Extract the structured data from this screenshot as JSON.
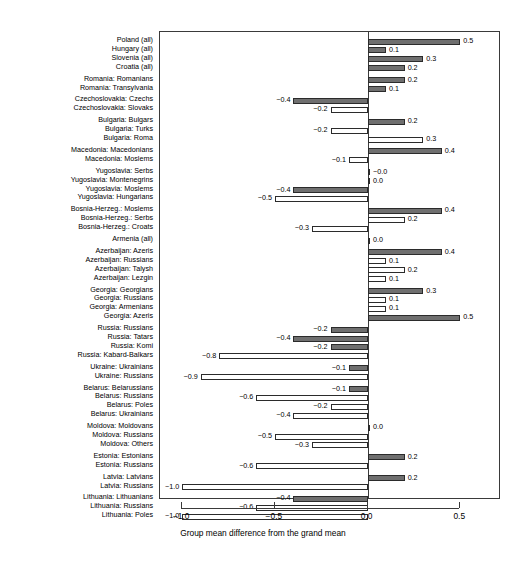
{
  "chart_data": {
    "type": "bar",
    "orientation": "horizontal",
    "title": "",
    "subtitle": "",
    "xlabel": "Group mean difference from the grand mean",
    "ylabel": "",
    "xlim": [
      -1.12,
      0.72
    ],
    "xticks": [
      -1.0,
      -0.5,
      0.0,
      0.5
    ],
    "xticklabels": [
      "-1.0",
      "-0.5",
      "0.0",
      "0.5"
    ],
    "grid": false,
    "legend": null,
    "series_note": "Filled bars = titular / majority group; open (white) bars = minority group",
    "categories": [
      "Poland (all)",
      "Hungary (all)",
      "Slovenia (all)",
      "Croatia (all)",
      "Romania: Romanians",
      "Romania: Transylvania",
      "Czechoslovakia: Czechs",
      "Czechoslovakia: Slovaks",
      "Bulgaria: Bulgars",
      "Bulgaria: Turks",
      "Bulgaria: Roma",
      "Macedonia: Macedonians",
      "Macedonia: Moslems",
      "Yugoslavia: Serbs",
      "Yugoslavia: Montenegrins",
      "Yugoslavia: Moslems",
      "Yugoslavia: Hungarians",
      "Bosnia-Herzeg.: Moslems",
      "Bosnia-Herzeg.: Serbs",
      "Bosnia-Herzeg.: Croats",
      "Armenia (all)",
      "Azerbaijan: Azeris",
      "Azerbaijan: Russians",
      "Azerbaijan: Talysh",
      "Azerbaijan: Lezgin",
      "Georgia: Georgians",
      "Georgia: Russians",
      "Georgia: Armenians",
      "Georgia: Azeris",
      "Russia: Russians",
      "Russia: Tatars",
      "Russia: Komi",
      "Russia: Kabard-Balkars",
      "Ukraine: Ukrainians",
      "Ukraine: Russians",
      "Belarus: Belarussians",
      "Belarus: Russians",
      "Belarus: Poles",
      "Belarus: Ukrainians",
      "Moldova: Moldovans",
      "Moldova: Russians",
      "Moldova: Others",
      "Estonia: Estonians",
      "Estonia: Russians",
      "Latvia: Latvians",
      "Latvia: Russians",
      "Lithuania: Lithuanians",
      "Lithuania: Russians",
      "Lithuania: Poles"
    ],
    "values": [
      0.5,
      0.1,
      0.3,
      0.2,
      0.2,
      0.1,
      -0.4,
      -0.2,
      0.2,
      -0.2,
      0.3,
      0.4,
      -0.1,
      -0.0,
      0.0,
      -0.4,
      -0.5,
      0.4,
      0.2,
      -0.3,
      0.0,
      0.4,
      0.1,
      0.2,
      0.1,
      0.3,
      0.1,
      0.1,
      0.5,
      -0.2,
      -0.4,
      -0.2,
      -0.8,
      -0.1,
      -0.9,
      -0.1,
      -0.6,
      -0.2,
      -0.4,
      0.0,
      -0.5,
      -0.3,
      0.2,
      -0.6,
      0.2,
      -1.0,
      -0.4,
      -0.6,
      -1.0
    ],
    "value_labels": [
      "0.5",
      "0.1",
      "0.3",
      "0.2",
      "0.2",
      "0.1",
      "-0.4",
      "-0.2",
      "0.2",
      "-0.2",
      "0.3",
      "0.4",
      "-0.1",
      "-0.0",
      "0.0",
      "-0.4",
      "-0.5",
      "0.4",
      "0.2",
      "-0.3",
      "0.0",
      "0.4",
      "0.1",
      "0.2",
      "0.1",
      "0.3",
      "0.1",
      "0.1",
      "0.5",
      "-0.2",
      "-0.4",
      "-0.2",
      "-0.8",
      "-0.1",
      "-0.9",
      "-0.1",
      "-0.6",
      "-0.2",
      "-0.4",
      "0.0",
      "-0.5",
      "-0.3",
      "0.2",
      "-0.6",
      "0.2",
      "-1.0",
      "-0.4",
      "-0.6",
      "-1.0"
    ],
    "fills": [
      "filled",
      "filled",
      "filled",
      "filled",
      "filled",
      "filled",
      "filled",
      "open",
      "filled",
      "open",
      "open",
      "filled",
      "open",
      "open",
      "filled",
      "filled",
      "open",
      "filled",
      "open",
      "open",
      "open",
      "filled",
      "open",
      "open",
      "open",
      "filled",
      "open",
      "open",
      "filled",
      "filled",
      "filled",
      "filled",
      "open",
      "filled",
      "open",
      "filled",
      "open",
      "open",
      "open",
      "filled",
      "open",
      "open",
      "filled",
      "open",
      "filled",
      "open",
      "filled",
      "open",
      "open"
    ]
  },
  "axis": {
    "x_title": "Group mean difference from the grand mean",
    "tick_0": "-1.0",
    "tick_1": "-0.5",
    "tick_2": "0.0",
    "tick_3": "0.5"
  },
  "colors": {
    "bar_filled": "#6f6f6f",
    "bar_open": "#ffffff",
    "bar_edge": "#2b2b2b",
    "frame": "#3a3a3a",
    "text": "#000000",
    "background": "#ffffff"
  }
}
